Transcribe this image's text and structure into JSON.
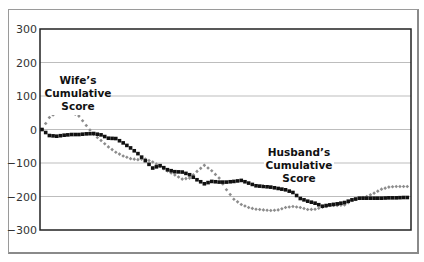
{
  "chart_data": {
    "type": "line",
    "title": "",
    "xlabel": "",
    "ylabel": "",
    "ylim": [
      -300,
      300
    ],
    "yticks": [
      300,
      200,
      100,
      0,
      -100,
      -200,
      -300
    ],
    "ytick_labels": [
      "300",
      "200",
      "100",
      "0",
      "−100",
      "−200",
      "−300"
    ],
    "grid": true,
    "legend": "none (inline annotations)",
    "x": [
      0,
      2,
      4,
      6,
      8,
      10,
      12,
      14,
      16,
      18,
      20,
      22,
      24,
      26,
      28,
      30,
      32,
      34,
      36,
      38,
      40,
      42,
      44,
      46,
      48,
      50,
      52,
      54,
      56,
      58,
      60,
      62,
      64,
      66,
      68,
      70,
      72,
      74,
      76,
      78,
      80,
      82,
      84,
      86,
      88,
      90,
      92,
      94,
      96,
      98,
      100
    ],
    "series": [
      {
        "name": "Wife's Cumulative Score",
        "color": "#8c8c8c",
        "marker": "diamond",
        "values": [
          0,
          36,
          51,
          51,
          51,
          40,
          12,
          -15,
          -33,
          -52,
          -68,
          -79,
          -87,
          -90,
          -88,
          -97,
          -110,
          -124,
          -136,
          -148,
          -145,
          -125,
          -107,
          -123,
          -145,
          -180,
          -208,
          -224,
          -233,
          -238,
          -240,
          -242,
          -240,
          -233,
          -230,
          -233,
          -239,
          -238,
          -232,
          -227,
          -227,
          -225,
          -212,
          -206,
          -200,
          -190,
          -178,
          -172,
          -170,
          -170,
          -170
        ]
      },
      {
        "name": "Husband's Cumulative Score",
        "color": "#111111",
        "marker": "square",
        "values": [
          0,
          -18,
          -20,
          -17,
          -15,
          -15,
          -13,
          -12,
          -16,
          -26,
          -27,
          -40,
          -55,
          -72,
          -93,
          -115,
          -108,
          -120,
          -126,
          -127,
          -135,
          -150,
          -162,
          -155,
          -157,
          -157,
          -155,
          -152,
          -160,
          -168,
          -170,
          -172,
          -176,
          -180,
          -188,
          -206,
          -214,
          -220,
          -229,
          -225,
          -222,
          -218,
          -210,
          -205,
          -205,
          -205,
          -205,
          -204,
          -204,
          -203,
          -203
        ]
      }
    ],
    "annotations": [
      {
        "text": [
          "Wife's",
          "Cumulative",
          "Score"
        ],
        "near_series": "Wife's Cumulative Score"
      },
      {
        "text": [
          "Husband's",
          "Cumulative",
          "Score"
        ],
        "near_series": "Husband's Cumulative Score"
      }
    ]
  },
  "annotations": {
    "wife": [
      "Wife’s",
      "Cumulative",
      "Score"
    ],
    "husband": [
      "Husband’s",
      "Cumulative",
      "Score"
    ]
  }
}
